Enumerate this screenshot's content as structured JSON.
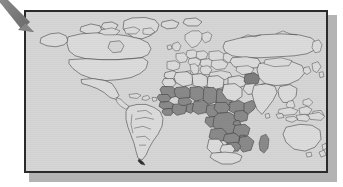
{
  "figure": {
    "type": "world-map",
    "annotation": {
      "arrow_label": "arrow pointing to map",
      "arrow_color": "#7d7d7d",
      "arrow_points_to": "map-top-left-corner"
    },
    "colors": {
      "ocean_background": "#d6d6d6",
      "land_unhighlighted": "#dcdcdc",
      "land_highlighted": "#8a8a8a",
      "country_border": "#3a3a3a",
      "frame_border": "#2b2b2b",
      "frame_shadow": "#b4b4b4",
      "page_background": "#ffffff"
    },
    "legend": {
      "highlighted_label": "Highlighted countries",
      "unhighlighted_label": "Other countries"
    },
    "regions": {
      "highlighted": [
        "Mauritania",
        "Mali",
        "Niger",
        "Chad",
        "Sudan",
        "Senegal",
        "Gambia",
        "Guinea-Bissau",
        "Guinea",
        "Sierra Leone",
        "Liberia",
        "Ivory Coast",
        "Burkina Faso",
        "Ghana",
        "Togo",
        "Benin",
        "Nigeria",
        "Cameroon",
        "Central African Republic",
        "Equatorial Guinea",
        "Gabon",
        "Congo",
        "Democratic Republic of the Congo",
        "Uganda",
        "Kenya",
        "Rwanda",
        "Burundi",
        "Tanzania",
        "Angola",
        "Zambia",
        "Malawi",
        "Mozambique",
        "Zimbabwe",
        "Madagascar",
        "Ethiopia",
        "Somalia",
        "Eritrea",
        "Djibouti",
        "Afghanistan"
      ],
      "unhighlighted": [
        "North America",
        "South America",
        "Europe",
        "North Africa",
        "Russia",
        "China",
        "India",
        "Southeast Asia",
        "Australia",
        "Greenland"
      ]
    },
    "frame": {
      "x": 24,
      "y": 10,
      "width": 304,
      "height": 163
    }
  }
}
